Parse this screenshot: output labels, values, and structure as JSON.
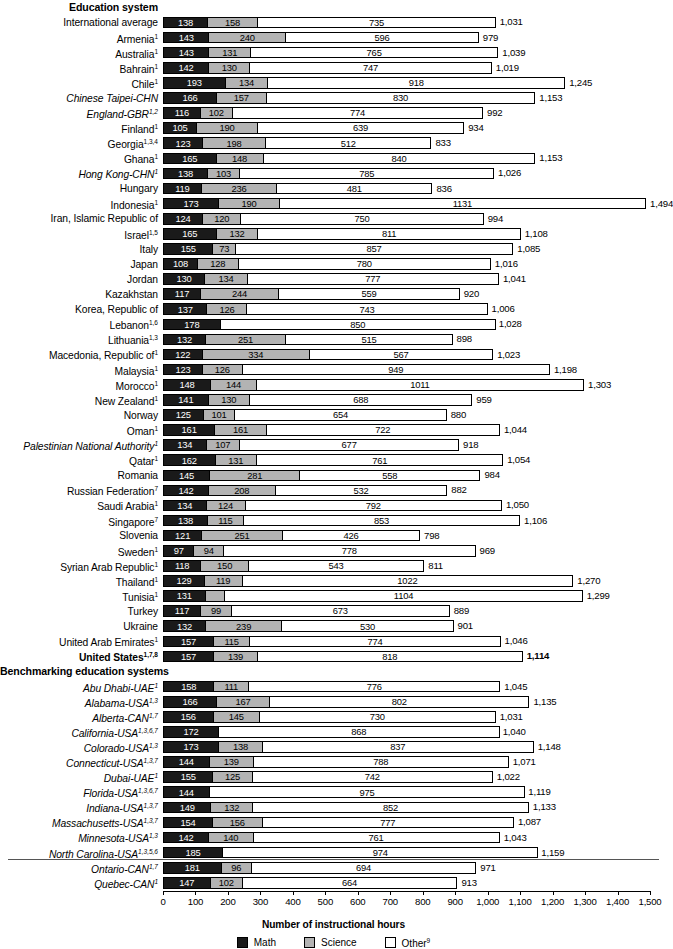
{
  "axis": {
    "title": "Number of instructional hours",
    "ticks": [
      "0",
      "100",
      "200",
      "300",
      "400",
      "500",
      "600",
      "700",
      "800",
      "900",
      "1,000",
      "1,100",
      "1,200",
      "1,300",
      "1,400",
      "1,500"
    ],
    "min": 0,
    "max": 1500
  },
  "legend": {
    "position": "bottom-center",
    "items": [
      {
        "key": "math",
        "label": "Math",
        "sup": "",
        "color": "#1a1a1a"
      },
      {
        "key": "science",
        "label": "Science",
        "sup": "",
        "color": "#b3b3b3"
      },
      {
        "key": "other",
        "label": "Other",
        "sup": "9",
        "color": "#ffffff"
      }
    ]
  },
  "sections": [
    {
      "title": "Education system"
    },
    {
      "title": "Benchmarking education systems"
    }
  ],
  "chart_data": {
    "type": "bar",
    "orientation": "horizontal",
    "stacked": true,
    "title": "",
    "xlabel": "Number of instructional hours",
    "ylabel": "",
    "xlim": [
      0,
      1500
    ],
    "grid": false,
    "series": [
      {
        "name": "Math",
        "color": "#1a1a1a"
      },
      {
        "name": "Science",
        "color": "#b3b3b3"
      },
      {
        "name": "Other",
        "color": "#ffffff"
      }
    ],
    "sections": [
      {
        "title": "Education system",
        "rows": [
          {
            "label": "International average",
            "sup": "",
            "style": "plain",
            "math": 138,
            "science": 158,
            "other": 735,
            "total": "1,031"
          },
          {
            "label": "Armenia",
            "sup": "1",
            "style": "plain",
            "math": 143,
            "science": 240,
            "other": 596,
            "total": "979"
          },
          {
            "label": "Australia",
            "sup": "1",
            "style": "plain",
            "math": 143,
            "science": 131,
            "other": 765,
            "total": "1,039"
          },
          {
            "label": "Bahrain",
            "sup": "1",
            "style": "plain",
            "math": 142,
            "science": 130,
            "other": 747,
            "total": "1,019"
          },
          {
            "label": "Chile",
            "sup": "1",
            "style": "plain",
            "math": 193,
            "science": 134,
            "other": 918,
            "total": "1,245"
          },
          {
            "label": "Chinese Taipei-CHN",
            "sup": "",
            "style": "italic",
            "math": 166,
            "science": 157,
            "other": 830,
            "total": "1,153"
          },
          {
            "label": "England-GBR",
            "sup": "1,2",
            "style": "italic",
            "math": 116,
            "science": 102,
            "other": 774,
            "total": "992"
          },
          {
            "label": "Finland",
            "sup": "1",
            "style": "plain",
            "math": 105,
            "science": 190,
            "other": 639,
            "total": "934"
          },
          {
            "label": "Georgia",
            "sup": "1,3,4",
            "style": "plain",
            "math": 123,
            "science": 198,
            "other": 512,
            "total": "833"
          },
          {
            "label": "Ghana",
            "sup": "1",
            "style": "plain",
            "math": 165,
            "science": 148,
            "other": 840,
            "total": "1,153"
          },
          {
            "label": "Hong Kong-CHN",
            "sup": "1",
            "style": "italic",
            "math": 138,
            "science": 103,
            "other": 785,
            "total": "1,026"
          },
          {
            "label": "Hungary",
            "sup": "",
            "style": "plain",
            "math": 119,
            "science": 236,
            "other": 481,
            "total": "836"
          },
          {
            "label": "Indonesia",
            "sup": "1",
            "style": "plain",
            "math": 173,
            "science": 190,
            "other": 1131,
            "total": "1,494"
          },
          {
            "label": "Iran, Islamic Republic of",
            "sup": "",
            "style": "plain",
            "math": 124,
            "science": 120,
            "other": 750,
            "total": "994"
          },
          {
            "label": "Israel",
            "sup": "1,5",
            "style": "plain",
            "math": 165,
            "science": 132,
            "other": 811,
            "total": "1,108"
          },
          {
            "label": "Italy",
            "sup": "",
            "style": "plain",
            "math": 155,
            "science": 73,
            "other": 857,
            "total": "1,085"
          },
          {
            "label": "Japan",
            "sup": "",
            "style": "plain",
            "math": 108,
            "science": 128,
            "other": 780,
            "total": "1,016"
          },
          {
            "label": "Jordan",
            "sup": "",
            "style": "plain",
            "math": 130,
            "science": 134,
            "other": 777,
            "total": "1,041"
          },
          {
            "label": "Kazakhstan",
            "sup": "",
            "style": "plain",
            "math": 117,
            "science": 244,
            "other": 559,
            "total": "920"
          },
          {
            "label": "Korea, Republic of",
            "sup": "",
            "style": "plain",
            "math": 137,
            "science": 126,
            "other": 743,
            "total": "1,006"
          },
          {
            "label": "Lebanon",
            "sup": "1,6",
            "style": "plain",
            "math": 178,
            "science": 0,
            "other": 850,
            "total": "1,028"
          },
          {
            "label": "Lithuania",
            "sup": "1,3",
            "style": "plain",
            "math": 132,
            "science": 251,
            "other": 515,
            "total": "898"
          },
          {
            "label": "Macedonia, Republic of",
            "sup": "1",
            "style": "plain",
            "math": 122,
            "science": 334,
            "other": 567,
            "total": "1,023"
          },
          {
            "label": "Malaysia",
            "sup": "1",
            "style": "plain",
            "math": 123,
            "science": 126,
            "other": 949,
            "total": "1,198"
          },
          {
            "label": "Morocco",
            "sup": "1",
            "style": "plain",
            "math": 148,
            "science": 144,
            "other": 1011,
            "total": "1,303"
          },
          {
            "label": "New Zealand",
            "sup": "1",
            "style": "plain",
            "math": 141,
            "science": 130,
            "other": 688,
            "total": "959"
          },
          {
            "label": "Norway",
            "sup": "",
            "style": "plain",
            "math": 125,
            "science": 101,
            "other": 654,
            "total": "880"
          },
          {
            "label": "Oman",
            "sup": "1",
            "style": "plain",
            "math": 161,
            "science": 161,
            "other": 722,
            "total": "1,044"
          },
          {
            "label": "Palestinian National Authority",
            "sup": "1",
            "style": "italic",
            "math": 134,
            "science": 107,
            "other": 677,
            "total": "918"
          },
          {
            "label": "Qatar",
            "sup": "1",
            "style": "plain",
            "math": 162,
            "science": 131,
            "other": 761,
            "total": "1,054"
          },
          {
            "label": "Romania",
            "sup": "",
            "style": "plain",
            "math": 145,
            "science": 281,
            "other": 558,
            "total": "984"
          },
          {
            "label": "Russian Federation",
            "sup": "7",
            "style": "plain",
            "math": 142,
            "science": 208,
            "other": 532,
            "total": "882"
          },
          {
            "label": "Saudi Arabia",
            "sup": "1",
            "style": "plain",
            "math": 134,
            "science": 124,
            "other": 792,
            "total": "1,050"
          },
          {
            "label": "Singapore",
            "sup": "7",
            "style": "plain",
            "math": 138,
            "science": 115,
            "other": 853,
            "total": "1,106"
          },
          {
            "label": "Slovenia",
            "sup": "",
            "style": "plain",
            "math": 121,
            "science": 251,
            "other": 426,
            "total": "798"
          },
          {
            "label": "Sweden",
            "sup": "1",
            "style": "plain",
            "math": 97,
            "science": 94,
            "other": 778,
            "total": "969"
          },
          {
            "label": "Syrian Arab Republic",
            "sup": "1",
            "style": "plain",
            "math": 118,
            "science": 150,
            "other": 543,
            "total": "811"
          },
          {
            "label": "Thailand",
            "sup": "1",
            "style": "plain",
            "math": 129,
            "science": 119,
            "other": 1022,
            "total": "1,270"
          },
          {
            "label": "Tunisia",
            "sup": "1",
            "style": "plain",
            "math": 131,
            "science": 64,
            "other": 1104,
            "total": "1,299"
          },
          {
            "label": "Turkey",
            "sup": "",
            "style": "plain",
            "math": 117,
            "science": 99,
            "other": 673,
            "total": "889"
          },
          {
            "label": "Ukraine",
            "sup": "",
            "style": "plain",
            "math": 132,
            "science": 239,
            "other": 530,
            "total": "901"
          },
          {
            "label": "United Arab Emirates",
            "sup": "1",
            "style": "plain",
            "math": 157,
            "science": 115,
            "other": 774,
            "total": "1,046"
          },
          {
            "label": "United States",
            "sup": "1,7,8",
            "style": "bold",
            "math": 157,
            "science": 139,
            "other": 818,
            "total": "1,114"
          }
        ]
      },
      {
        "title": "Benchmarking education systems",
        "rows": [
          {
            "label": "Abu Dhabi-UAE",
            "sup": "1",
            "style": "italic",
            "math": 158,
            "science": 111,
            "other": 776,
            "total": "1,045"
          },
          {
            "label": "Alabama-USA",
            "sup": "1,3",
            "style": "italic",
            "math": 166,
            "science": 167,
            "other": 802,
            "total": "1,135"
          },
          {
            "label": "Alberta-CAN",
            "sup": "1,7",
            "style": "italic",
            "math": 156,
            "science": 145,
            "other": 730,
            "total": "1,031"
          },
          {
            "label": "California-USA",
            "sup": "1,3,6,7",
            "style": "italic",
            "math": 172,
            "science": 0,
            "other": 868,
            "total": "1,040"
          },
          {
            "label": "Colorado-USA",
            "sup": "1,3",
            "style": "italic",
            "math": 173,
            "science": 138,
            "other": 837,
            "total": "1,148"
          },
          {
            "label": "Connecticut-USA",
            "sup": "1,3,7",
            "style": "italic",
            "math": 144,
            "science": 139,
            "other": 788,
            "total": "1,071"
          },
          {
            "label": "Dubai-UAE",
            "sup": "1",
            "style": "italic",
            "math": 155,
            "science": 125,
            "other": 742,
            "total": "1,022"
          },
          {
            "label": "Florida-USA",
            "sup": "1,3,6,7",
            "style": "italic",
            "math": 144,
            "science": 0,
            "other": 975,
            "total": "1,119"
          },
          {
            "label": "Indiana-USA",
            "sup": "1,3,7",
            "style": "italic",
            "math": 149,
            "science": 132,
            "other": 852,
            "total": "1,133"
          },
          {
            "label": "Massachusetts-USA",
            "sup": "1,3,7",
            "style": "italic",
            "math": 154,
            "science": 156,
            "other": 777,
            "total": "1,087"
          },
          {
            "label": "Minnesota-USA",
            "sup": "1,3",
            "style": "italic",
            "math": 142,
            "science": 140,
            "other": 761,
            "total": "1,043"
          },
          {
            "label": "North Carolina-USA",
            "sup": "1,3,5,6",
            "style": "italic",
            "math": 185,
            "science": 0,
            "other": 974,
            "total": "1,159"
          },
          {
            "label": "Ontario-CAN",
            "sup": "1,7",
            "style": "italic",
            "math": 181,
            "science": 96,
            "other": 694,
            "total": "971"
          },
          {
            "label": "Quebec-CAN",
            "sup": "1",
            "style": "italic",
            "math": 147,
            "science": 102,
            "other": 664,
            "total": "913"
          }
        ]
      }
    ]
  }
}
